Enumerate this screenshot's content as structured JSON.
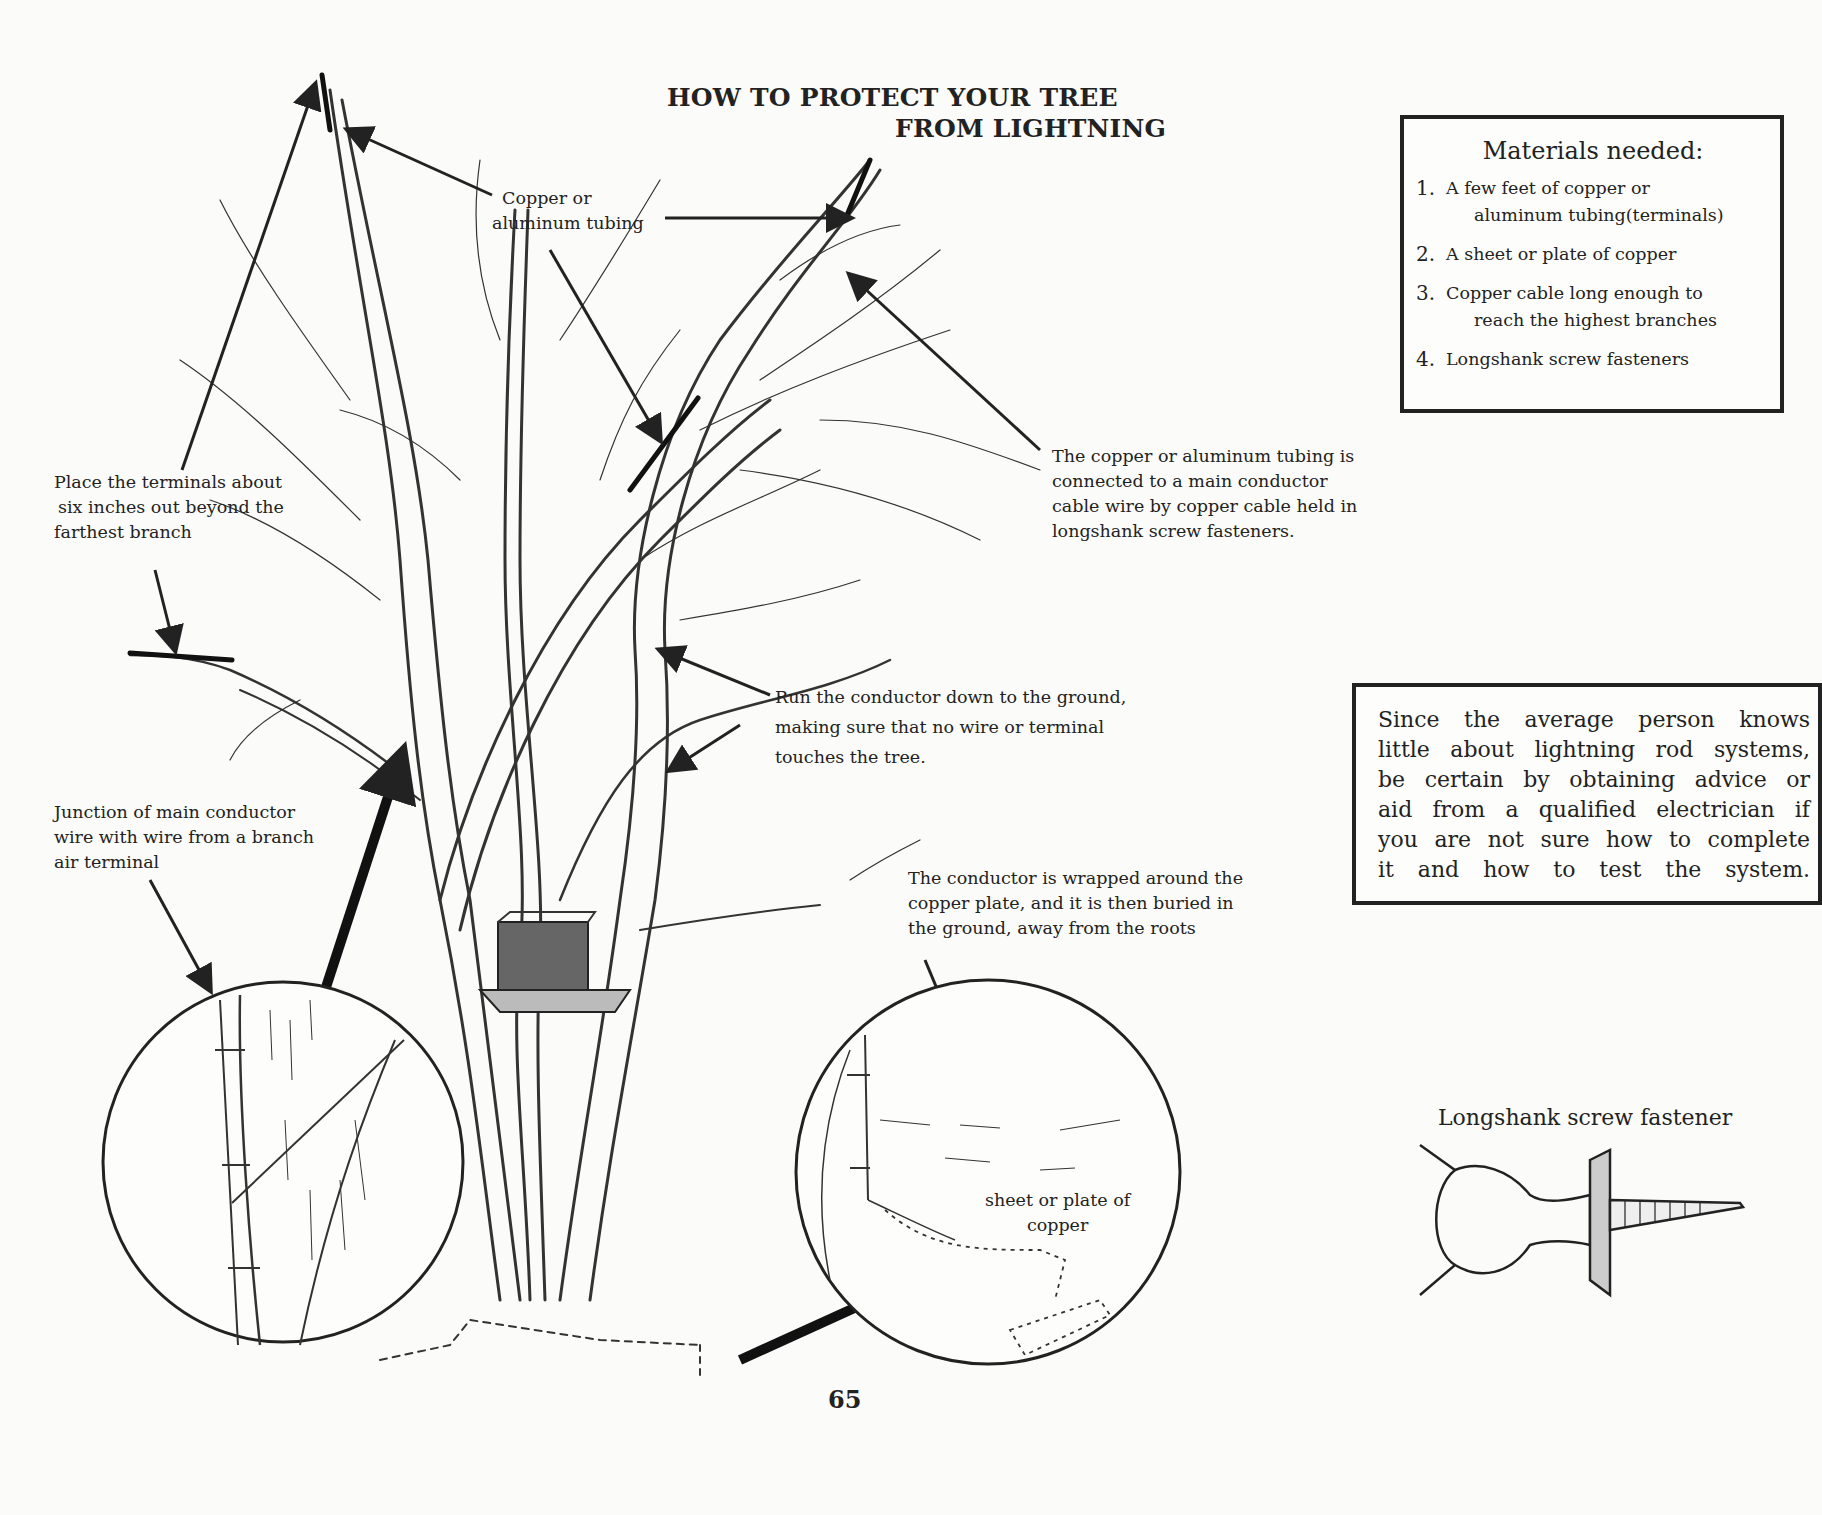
{
  "page": {
    "title_line1": "HOW TO PROTECT YOUR TREE",
    "title_line2": "FROM LIGHTNING",
    "page_number": "65"
  },
  "materials": {
    "heading": "Materials needed:",
    "items": [
      {
        "num": "1.",
        "line1": "A few feet of copper or",
        "line2": "aluminum tubing(terminals)"
      },
      {
        "num": "2.",
        "line1": "A sheet or plate of copper",
        "line2": ""
      },
      {
        "num": "3.",
        "line1": "Copper cable long enough to",
        "line2": "reach the highest branches"
      },
      {
        "num": "4.",
        "line1": "Longshank screw fasteners",
        "line2": ""
      }
    ]
  },
  "advice": {
    "lines": [
      "Since the average person knows",
      "little about lightning rod systems,",
      "be certain by obtaining advice or",
      "aid from a qualified electrician if",
      "you are not sure how to complete",
      "it and how to test the system."
    ]
  },
  "callouts": {
    "tubing": {
      "line1": "Copper or",
      "line2": "aluminum tubing"
    },
    "terminals": {
      "line1": "Place the terminals about",
      "line2": "six inches out beyond the",
      "line3": "farthest branch"
    },
    "junction": {
      "line1": "Junction of main conductor",
      "line2": "wire with wire from a branch",
      "line3": "air terminal"
    },
    "connected": {
      "line1": "The copper or aluminum tubing is",
      "line2": "connected to a main conductor",
      "line3": "cable wire by copper cable held in",
      "line4": "longshank screw fasteners."
    },
    "run_conductor": {
      "line1": "Run the conductor down to the ground,",
      "line2": "making sure that no wire or terminal",
      "line3": "touches the tree."
    },
    "wrapped": {
      "line1": "The conductor is wrapped around the",
      "line2": "copper plate, and it is then buried in",
      "line3": "the ground, away from the roots"
    },
    "plate": {
      "line1": "sheet or plate of",
      "line2": "copper"
    }
  },
  "fastener": {
    "label": "Longshank screw fastener"
  },
  "colors": {
    "paper": "#fbfbf9",
    "ink": "#222222"
  }
}
